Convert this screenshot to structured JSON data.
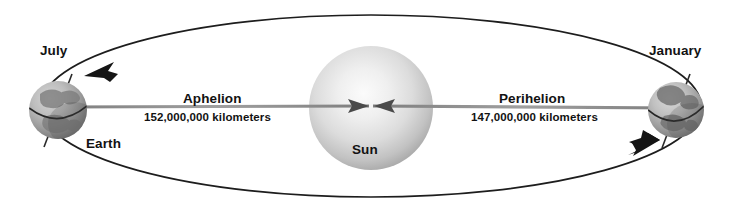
{
  "diagram": {
    "background_color": "#ffffff",
    "labels": {
      "july": "July",
      "january": "January",
      "earth": "Earth",
      "sun": "Sun",
      "aphelion": "Aphelion",
      "aphelion_distance": "152,000,000 kilometers",
      "perihelion": "Perihelion",
      "perihelion_distance": "147,000,000 kilometers"
    },
    "colors": {
      "text": "#121212",
      "orbit_line": "#1a1a1a",
      "axis_line": "#8a8a8a",
      "sun_core": "#f2f2f2",
      "sun_edge": "#9a9a9a",
      "earth_light": "#c9c9c9",
      "earth_dark": "#6e6e6e",
      "earth_land": "#7d7d7d"
    },
    "geometry": {
      "orbit_center_x": 371,
      "orbit_center_y": 106,
      "orbit_radius_x": 330,
      "orbit_radius_y": 92,
      "sun_center_x": 371,
      "sun_center_y": 108,
      "sun_radius": 62,
      "earth_july_x": 58,
      "earth_july_y": 110,
      "earth_july_radius": 29,
      "earth_january_x": 676,
      "earth_january_y": 110,
      "earth_january_radius": 28
    }
  }
}
